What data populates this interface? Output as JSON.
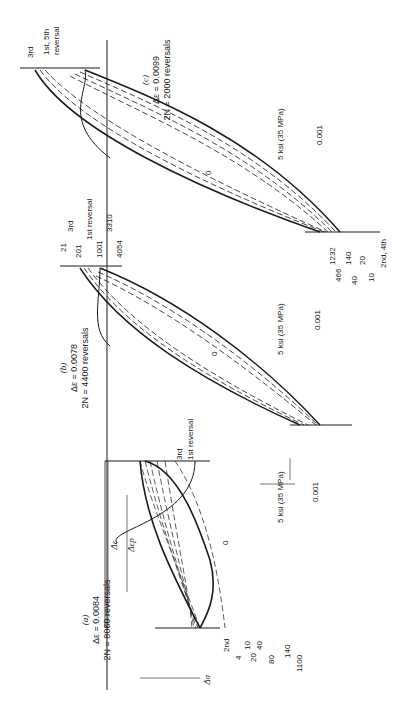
{
  "figure": {
    "orientation": "rotated 90 degrees clockwise",
    "axis_origin_label": "0",
    "panels": [
      {
        "id": "a",
        "caption_letter": "(a)",
        "strain_range": "Δε = 0.0084",
        "reversals": "2N = 8060 reversals",
        "dimension_labels": [
          "Δε",
          "Δεp",
          "Δσ"
        ],
        "top_labels": [
          "3rd",
          "1st  reversal"
        ],
        "bottom_labels": [
          "2nd",
          "4",
          "10",
          "20",
          "40",
          "80",
          "140",
          "1100"
        ],
        "stress_scale": "5 ksi  (35 MPa)",
        "strain_scale": "0.001"
      },
      {
        "id": "b",
        "caption_letter": "(b)",
        "strain_range": "Δε = 0.0078",
        "reversals": "2N = 4400 reversals",
        "top_labels": [
          "21",
          "3rd",
          "201",
          "1st  reversal",
          "1001",
          "3310",
          "4054"
        ],
        "bottom_labels": [
          "1232",
          "466",
          "140",
          "40",
          "20",
          "10",
          "2nd, 4th"
        ],
        "stress_scale": "5 ksi  (35 MPa)",
        "strain_scale": "0.001"
      },
      {
        "id": "c",
        "caption_letter": "(c)",
        "strain_range": "Δε = 0.0099",
        "reversals": "2N = 2000 reversals",
        "top_labels": [
          "3rd",
          "1st, 5th",
          "reversal"
        ],
        "stress_scale": "5 ksi  (35 MPa)",
        "strain_scale": "0.001"
      }
    ]
  }
}
